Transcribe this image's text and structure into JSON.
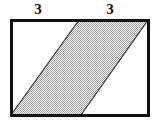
{
  "figure": {
    "type": "geometry-diagram",
    "background_color": "#ffffff",
    "labels": [
      {
        "name": "left-top-segment",
        "text": "3",
        "x": 38,
        "y": 9
      },
      {
        "name": "right-top-segment",
        "text": "3",
        "x": 110,
        "y": 9
      }
    ],
    "rectangle": {
      "name": "outer-rectangle",
      "x": 11,
      "y": 20,
      "width": 137,
      "height": 95,
      "stroke": "#111111",
      "stroke_width": 3,
      "fill": "#ffffff"
    },
    "parallelogram": {
      "name": "shaded-parallelogram",
      "points": "11,115 79,20 148,20 81,115",
      "fill": "#b3b3b3",
      "fill_pattern": "checkerboard-stipple",
      "pattern_colors": [
        "#9a9a9a",
        "#ffffff"
      ],
      "stroke": "#333333",
      "stroke_width": 1.2
    }
  }
}
